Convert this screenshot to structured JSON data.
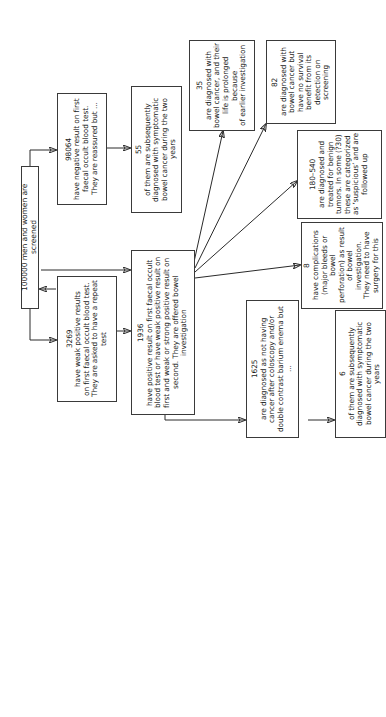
{
  "diagram": {
    "nodes": {
      "root": {
        "label": "100000 men and women are screened"
      },
      "negative": {
        "count": "98064",
        "text": "have negative result on first\nfaecal occult blood test.\nThey are reassured but ..."
      },
      "negative_cancer": {
        "count": "55",
        "text": "of them are subsequently\ndiagnosed with symptomatic\nbowel cancer during the two years"
      },
      "weak_positive": {
        "count": "3269",
        "text": "have weak positive results\non first faecal occult blood test.\nThey are asked to have a repeat\ntest"
      },
      "positive": {
        "count": "1936",
        "text": "have positive result on first faecal occult\nblood test or have weak positive result on\nfirst and weak or strong positive result on\nsecond. They are offered bowel investigation"
      },
      "prolonged": {
        "count": "35",
        "text": "are diagnosed with\nbowel cancer, and their\nlife is prolonged because\nof earlier investigation"
      },
      "no_benefit": {
        "count": "82",
        "text": "are diagnosed with\nbowel cancer but\nhave no survival\nbenefit from its\ndetection on screening"
      },
      "benign": {
        "count": "180–540",
        "text": "are diagnosed and\ntreated for benign\ntumors. In some (?30)\nthese are categorized\nas ‘suspicious’ and are\nfollowed up"
      },
      "complications": {
        "count": "8",
        "text": "have complications\n(major bleeds or bowel\nperforation) as result\nof bowel investigation.\nThey need to have\nsurgery for this"
      },
      "not_cancer": {
        "count": "1625",
        "text": "are diagnosed as not having\ncancer after coloscopy and/or\ndouble contrast barium enema but ..."
      },
      "not_cancer_later": {
        "count": "6",
        "text": "of them are subsequently\ndiagnosed with symptomatic\nbowel cancer during the two years"
      }
    },
    "edges": [
      [
        "root",
        "negative"
      ],
      [
        "negative",
        "negative_cancer"
      ],
      [
        "root",
        "weak_positive"
      ],
      [
        "root",
        "positive"
      ],
      [
        "weak_positive",
        "root"
      ],
      [
        "weak_positive",
        "positive"
      ],
      [
        "positive",
        "prolonged"
      ],
      [
        "positive",
        "no_benefit"
      ],
      [
        "positive",
        "benign"
      ],
      [
        "positive",
        "complications"
      ],
      [
        "positive",
        "not_cancer"
      ],
      [
        "not_cancer",
        "not_cancer_later"
      ]
    ]
  }
}
